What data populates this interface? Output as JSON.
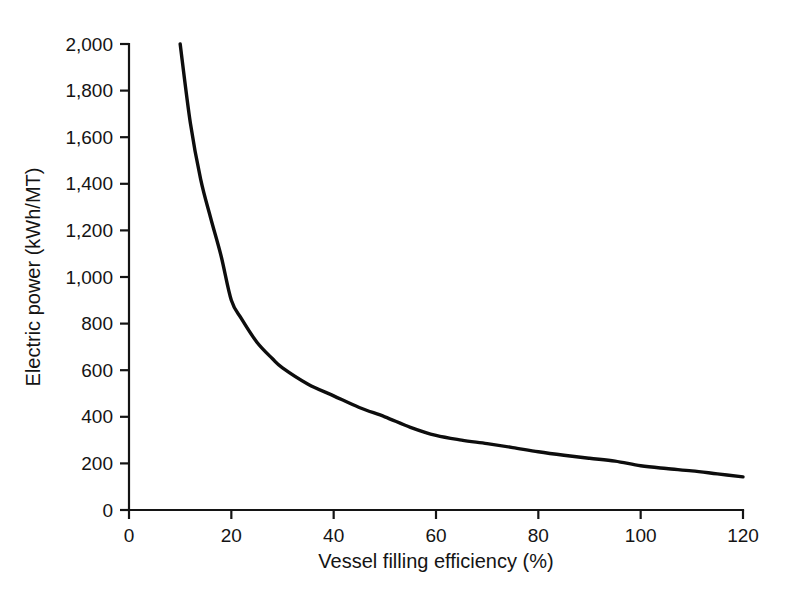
{
  "chart_data": {
    "type": "line",
    "title": "",
    "subtitle": "",
    "xlabel": "Vessel filling efficiency (%)",
    "ylabel": "Electric power (kWh/MT)",
    "xlim": [
      0,
      120
    ],
    "ylim": [
      0,
      2000
    ],
    "xticks": [
      0,
      20,
      40,
      60,
      80,
      100,
      120
    ],
    "yticks": [
      0,
      200,
      400,
      600,
      800,
      1000,
      1200,
      1400,
      1600,
      1800,
      2000
    ],
    "xtick_labels": [
      "0",
      "20",
      "40",
      "60",
      "80",
      "100",
      "120"
    ],
    "ytick_labels": [
      "0",
      "200",
      "400",
      "600",
      "800",
      "1,000",
      "1,200",
      "1,400",
      "1,600",
      "1,800",
      "2,000"
    ],
    "grid": false,
    "legend": false,
    "legend_position": "none",
    "series": [
      {
        "name": "Electric power vs vessel filling efficiency",
        "color": "#0d0d0d",
        "line_width": 3.4,
        "marker": "none",
        "x": [
          10,
          12,
          14,
          16,
          18,
          20,
          22,
          25,
          28,
          30,
          35,
          40,
          45,
          50,
          55,
          60,
          65,
          70,
          75,
          80,
          85,
          90,
          95,
          100,
          105,
          110,
          115,
          120
        ],
        "y": [
          2000,
          1660,
          1420,
          1250,
          1090,
          900,
          820,
          720,
          650,
          610,
          540,
          490,
          440,
          400,
          355,
          320,
          300,
          285,
          268,
          250,
          235,
          222,
          210,
          190,
          178,
          168,
          155,
          142
        ]
      }
    ]
  },
  "figure": {
    "background_color": "#ffffff",
    "axis_color": "#141414",
    "curve_color": "#0d0d0d",
    "tick_direction": "out"
  }
}
